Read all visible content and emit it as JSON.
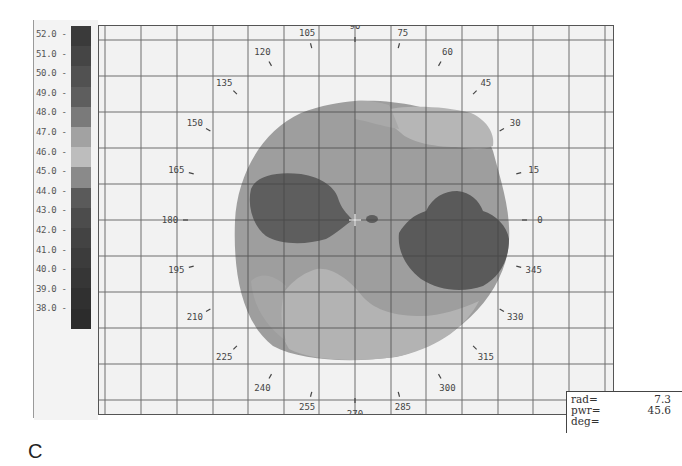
{
  "panel_label": "C",
  "readout": {
    "rows": [
      {
        "key": "rad=",
        "value": "7.3"
      },
      {
        "key": "pwr=",
        "value": "45.6"
      },
      {
        "key": "deg=",
        "value": ""
      }
    ]
  },
  "colorbar": {
    "ticks": [
      "52.0",
      "51.0",
      "50.0",
      "49.0",
      "48.0",
      "47.0",
      "46.0",
      "45.0",
      "44.0",
      "43.0",
      "42.0",
      "41.0",
      "40.0",
      "39.0",
      "38.0"
    ],
    "colors": [
      "#3a3a3a",
      "#454545",
      "#515151",
      "#5e5e5e",
      "#7a7a7a",
      "#a2a2a2",
      "#bdbdbd",
      "#8a8a8a",
      "#5a5a5a",
      "#4c4c4c",
      "#434343",
      "#3c3c3c",
      "#363636",
      "#303030",
      "#2c2c2c"
    ]
  },
  "chart_data": {
    "type": "heatmap",
    "title": "",
    "subtype": "polar corneal topography (power map)",
    "units": "diopters",
    "colorbar_range": [
      38.0,
      52.0
    ],
    "colorbar_step": 1.0,
    "angle_labels": [
      "0",
      "15",
      "30",
      "45",
      "60",
      "75",
      "90",
      "105",
      "120",
      "135",
      "150",
      "165",
      "180",
      "195",
      "210",
      "225",
      "240",
      "255",
      "270",
      "285",
      "300",
      "315",
      "330",
      "345"
    ],
    "grid": true,
    "cursor": {
      "rad": 7.3,
      "pwr": 45.6,
      "deg": null
    },
    "regions": [
      {
        "name": "background-disc",
        "approx_power": 45.5
      },
      {
        "name": "nasal-flat-zone-left",
        "approx_power": 44.0,
        "location": "180 deg"
      },
      {
        "name": "temporal-flat-zone-right",
        "approx_power": 44.0,
        "location": "345 deg"
      },
      {
        "name": "superior-steep-zone",
        "approx_power": 47.0,
        "location": "75 deg"
      },
      {
        "name": "inferior-steep-zone",
        "approx_power": 47.0,
        "location": "255-285 deg"
      }
    ]
  }
}
